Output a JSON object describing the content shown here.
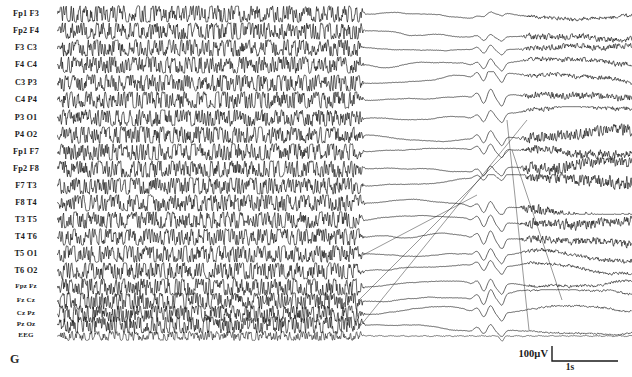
{
  "figure": {
    "panel_letter": "G",
    "type": "eeg-recording",
    "ink_color": "#111111",
    "background_color": "#ffffff"
  },
  "channels": [
    {
      "label": "Fp1 F3",
      "size": "normal"
    },
    {
      "label": "Fp2 F4",
      "size": "normal"
    },
    {
      "label": "F3 C3",
      "size": "normal"
    },
    {
      "label": "F4 C4",
      "size": "normal"
    },
    {
      "label": "C3 P3",
      "size": "normal"
    },
    {
      "label": "C4 P4",
      "size": "normal"
    },
    {
      "label": "P3 O1",
      "size": "normal"
    },
    {
      "label": "P4 O2",
      "size": "normal"
    },
    {
      "label": "Fp1 F7",
      "size": "normal"
    },
    {
      "label": "Fp2 F8",
      "size": "normal"
    },
    {
      "label": "F7 T3",
      "size": "normal"
    },
    {
      "label": "F8 T4",
      "size": "normal"
    },
    {
      "label": "T3 T5",
      "size": "normal"
    },
    {
      "label": "T4 T6",
      "size": "normal"
    },
    {
      "label": "T5 O1",
      "size": "normal"
    },
    {
      "label": "T6 O2",
      "size": "normal"
    },
    {
      "label": "Fpz Fz",
      "size": "small"
    },
    {
      "label": "Fz Cz",
      "size": "small"
    },
    {
      "label": "Cz Pz",
      "size": "small"
    },
    {
      "label": "Pz Oz",
      "size": "small"
    },
    {
      "label": "EEG",
      "size": "small"
    }
  ],
  "scalebar": {
    "amplitude": "100µV",
    "time": "1s"
  },
  "chart_data": {
    "type": "line",
    "title": "",
    "xlabel": "",
    "ylabel": "",
    "montage": "longitudinal bipolar",
    "n_channels": 21,
    "calibration": {
      "amplitude_uv": 100,
      "time_s": 1
    },
    "x_range_px": [
      0,
      575
    ],
    "segments": [
      {
        "name": "ictal",
        "x_start": 0,
        "x_end": 308,
        "description": "high-amplitude rhythmic chaotic seizure discharge, clipped, all channels",
        "amplitude": 1.0,
        "density": "very-high"
      },
      {
        "name": "postictal-suppression",
        "x_start": 308,
        "x_end": 575,
        "description": "attenuated drifting baselines with focal slow transients and EMG bursts",
        "amplitude": 0.18,
        "density": "low"
      }
    ],
    "events": [
      {
        "name": "seizure-offset",
        "x": 308
      },
      {
        "name": "slow-transient-cluster",
        "x": 430
      },
      {
        "name": "sharp-transient",
        "x": 445
      },
      {
        "name": "emg-burst-onset",
        "x": 460
      },
      {
        "name": "emg-burst-offset",
        "x": 575
      }
    ],
    "channel_traces": [
      {
        "channel": "Fp1 F3",
        "baseline_y": 14,
        "post_drift": -2,
        "emg": 0.25,
        "slow_amp": 0.15
      },
      {
        "channel": "Fp2 F4",
        "baseline_y": 31,
        "post_drift": -4,
        "emg": 0.45,
        "slow_amp": 0.25
      },
      {
        "channel": "F3 C3",
        "baseline_y": 48,
        "post_drift": 4,
        "emg": 0.4,
        "slow_amp": 0.35
      },
      {
        "channel": "F4 C4",
        "baseline_y": 65,
        "post_drift": 6,
        "emg": 0.35,
        "slow_amp": 0.4
      },
      {
        "channel": "C3 P3",
        "baseline_y": 83,
        "post_drift": 2,
        "emg": 0.3,
        "slow_amp": 0.55
      },
      {
        "channel": "C4 P4",
        "baseline_y": 100,
        "post_drift": 8,
        "emg": 0.5,
        "slow_amp": 0.6
      },
      {
        "channel": "P3 O1",
        "baseline_y": 118,
        "post_drift": 5,
        "emg": 0.35,
        "slow_amp": 0.45
      },
      {
        "channel": "P4 O2",
        "baseline_y": 135,
        "post_drift": -3,
        "emg": 0.85,
        "slow_amp": 0.5
      },
      {
        "channel": "Fp1 F7",
        "baseline_y": 152,
        "post_drift": 10,
        "emg": 0.6,
        "slow_amp": 0.45
      },
      {
        "channel": "Fp2 F8",
        "baseline_y": 169,
        "post_drift": -6,
        "emg": 0.95,
        "slow_amp": 0.4
      },
      {
        "channel": "F7 T3",
        "baseline_y": 186,
        "post_drift": 12,
        "emg": 1.0,
        "slow_amp": 0.35
      },
      {
        "channel": "F8 T4",
        "baseline_y": 203,
        "post_drift": 2,
        "emg": 0.9,
        "slow_amp": 0.5
      },
      {
        "channel": "T3 T5",
        "baseline_y": 220,
        "post_drift": -8,
        "emg": 0.7,
        "slow_amp": 0.55
      },
      {
        "channel": "T4 T6",
        "baseline_y": 237,
        "post_drift": 14,
        "emg": 0.55,
        "slow_amp": 0.6
      },
      {
        "channel": "T5 O1",
        "baseline_y": 254,
        "post_drift": -10,
        "emg": 0.3,
        "slow_amp": 0.5
      },
      {
        "channel": "T6 O2",
        "baseline_y": 271,
        "post_drift": 16,
        "emg": 0.2,
        "slow_amp": 0.45
      },
      {
        "channel": "Fpz Fz",
        "baseline_y": 287,
        "post_drift": -14,
        "emg": 0.18,
        "slow_amp": 0.55
      },
      {
        "channel": "Fz Cz",
        "baseline_y": 301,
        "post_drift": 18,
        "emg": 0.15,
        "slow_amp": 0.6
      },
      {
        "channel": "Cz Pz",
        "baseline_y": 314,
        "post_drift": -12,
        "emg": 0.12,
        "slow_amp": 0.5
      },
      {
        "channel": "Pz Oz",
        "baseline_y": 325,
        "post_drift": 8,
        "emg": 0.1,
        "slow_amp": 0.4
      },
      {
        "channel": "EEG",
        "baseline_y": 336,
        "post_drift": 0,
        "emg": 0.08,
        "slow_amp": 0.1
      }
    ]
  }
}
